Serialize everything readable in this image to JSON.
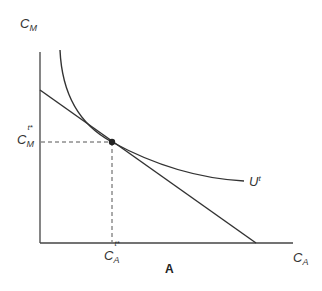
{
  "diagram": {
    "y_axis": {
      "label": "C",
      "subscript": "M"
    },
    "x_axis": {
      "label": "C",
      "subscript": "A"
    },
    "curve_label": {
      "label": "U",
      "superscript": "t"
    },
    "y_marker": {
      "label": "C",
      "subscript": "M",
      "superscript": "t*"
    },
    "x_marker": {
      "label": "C",
      "subscript": "A",
      "superscript": "t*"
    },
    "panel_label": "A",
    "colors": {
      "line": "#333333",
      "axis": "#444444"
    }
  }
}
